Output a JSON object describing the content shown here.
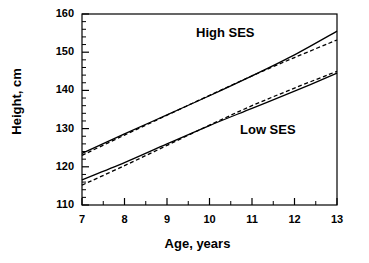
{
  "figure": {
    "background": "#ffffff",
    "line_color": "#000000"
  },
  "axes": {
    "ylabel": "Height, cm",
    "xlabel": "Age, years",
    "y_ticks": [
      "110",
      "120",
      "130",
      "140",
      "150",
      "160"
    ],
    "x_ticks": [
      "7",
      "8",
      "9",
      "10",
      "11",
      "12",
      "13"
    ]
  },
  "annotations": {
    "high": "High SES",
    "low": "Low SES"
  },
  "chart_data": {
    "type": "line",
    "title": "",
    "xlabel": "Age, years",
    "ylabel": "Height, cm",
    "xlim": [
      7,
      13
    ],
    "ylim": [
      110,
      160
    ],
    "x_ticks": [
      7,
      8,
      9,
      10,
      11,
      12,
      13
    ],
    "y_ticks": [
      110,
      120,
      130,
      140,
      150,
      160
    ],
    "x_minor_tick_step": 0.5,
    "y_minor_tick_step": 2,
    "grid": false,
    "legend": "none",
    "annotations": [
      {
        "text": "High SES",
        "x": 10.4,
        "y": 154.0
      },
      {
        "text": "Low SES",
        "x": 11.5,
        "y": 130.5
      }
    ],
    "x": [
      7,
      8,
      9,
      10,
      11,
      12,
      13
    ],
    "series": [
      {
        "name": "High SES observed",
        "style": "solid",
        "values": [
          123.5,
          128.6,
          133.6,
          138.6,
          143.8,
          149.3,
          155.5
        ]
      },
      {
        "name": "High SES predicted",
        "style": "dashed",
        "values": [
          123.0,
          128.3,
          133.5,
          138.7,
          143.8,
          148.6,
          153.2
        ]
      },
      {
        "name": "Low SES observed",
        "style": "solid",
        "values": [
          116.6,
          121.1,
          126.0,
          130.8,
          135.3,
          139.8,
          144.5
        ]
      },
      {
        "name": "Low SES predicted",
        "style": "dashed",
        "values": [
          115.2,
          120.3,
          125.6,
          130.9,
          136.0,
          140.6,
          145.0
        ]
      }
    ]
  }
}
